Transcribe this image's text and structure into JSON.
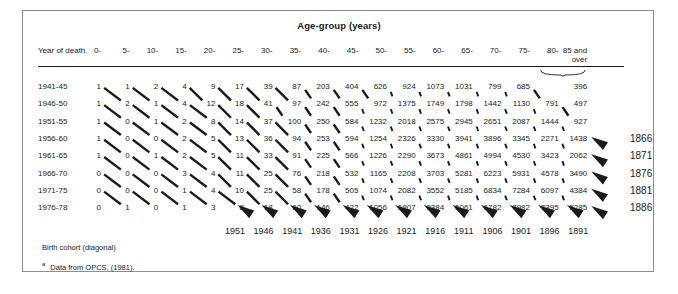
{
  "figure": {
    "title": "Age-group (years)",
    "row_header": "Year of death",
    "footnote_cohort": "Birth cohort (diagonal)",
    "footnote_marker": "a",
    "footnote_source": "Data from OPCS, (1981).",
    "over_label": "over",
    "accent_color": "#1a1a1a",
    "border_color": "#8c8c8c"
  },
  "chart_data": {
    "type": "table",
    "title": "Age-group (years)",
    "xlabel": "Age-group (years)",
    "ylabel": "Year of death",
    "categories": [
      "0-",
      "5-",
      "10-",
      "15-",
      "20-",
      "25-",
      "30-",
      "35-",
      "40-",
      "45-",
      "50-",
      "55-",
      "60-",
      "65-",
      "70-",
      "75-",
      "80-",
      "85 and"
    ],
    "row_labels": [
      "1941-45",
      "1946-50",
      "1951-55",
      "1956-60",
      "1961-65",
      "1966-70",
      "1971-75",
      "1976-78"
    ],
    "rows": [
      {
        "label": "1941-45",
        "values": [
          1,
          1,
          2,
          4,
          9,
          17,
          39,
          87,
          203,
          404,
          626,
          924,
          1073,
          1031,
          799,
          685,
          null,
          396
        ]
      },
      {
        "label": "1946-50",
        "values": [
          1,
          2,
          1,
          4,
          12,
          18,
          41,
          97,
          242,
          555,
          972,
          1375,
          1749,
          1798,
          1442,
          1130,
          791,
          497
        ]
      },
      {
        "label": "1951-55",
        "values": [
          1,
          0,
          1,
          2,
          8,
          14,
          37,
          100,
          250,
          584,
          1232,
          2018,
          2575,
          2945,
          2651,
          2087,
          1444,
          927
        ]
      },
      {
        "label": "1956-60",
        "values": [
          1,
          0,
          0,
          2,
          5,
          13,
          36,
          94,
          253,
          594,
          1254,
          2326,
          3330,
          3941,
          3896,
          3345,
          2271,
          1438
        ]
      },
      {
        "label": "1961-65",
        "values": [
          1,
          0,
          1,
          2,
          5,
          11,
          33,
          91,
          225,
          566,
          1226,
          2290,
          3673,
          4861,
          4994,
          4530,
          3423,
          2062
        ]
      },
      {
        "label": "1966-70",
        "values": [
          0,
          0,
          0,
          3,
          4,
          11,
          25,
          76,
          218,
          532,
          1165,
          2208,
          3703,
          5281,
          6223,
          5931,
          4578,
          3490
        ]
      },
      {
        "label": "1971-75",
        "values": [
          0,
          0,
          0,
          1,
          4,
          10,
          25,
          58,
          178,
          505,
          1074,
          2082,
          3552,
          5185,
          6834,
          7284,
          6097,
          4384
        ]
      },
      {
        "label": "1976-78",
        "values": [
          0,
          1,
          0,
          1,
          3,
          8,
          18,
          60,
          146,
          422,
          1056,
          1907,
          3384,
          5061,
          6782,
          7982,
          7395,
          5285
        ]
      }
    ],
    "cohort_years_right": [
      "1866",
      "1871",
      "1876",
      "1881",
      "1886"
    ],
    "cohort_years_bottom": [
      "1951",
      "1946",
      "1941",
      "1936",
      "1931",
      "1926",
      "1921",
      "1916",
      "1911",
      "1906",
      "1901",
      "1896",
      "1891"
    ],
    "grid": false,
    "legend": "Birth cohort (diagonal)"
  }
}
